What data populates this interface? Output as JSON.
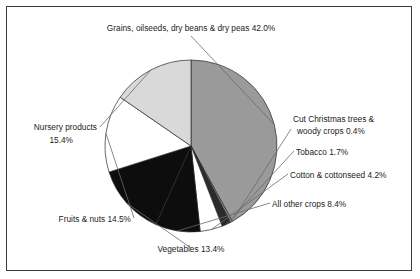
{
  "chart_data": {
    "type": "pie",
    "title": "",
    "subtitle": "",
    "xlabel": "",
    "ylabel": "",
    "legend_position": "none",
    "grid": false,
    "start_angle_deg": -90,
    "direction": "clockwise",
    "units": "percent",
    "total": 100.0,
    "categories": [
      "Grains, oilseeds, dry beans & dry peas",
      "Cut Christmas trees & woody crops",
      "Tobacco",
      "Cotton & cottonseed",
      "All other crops",
      "Vegetables",
      "Fruits & nuts",
      "Nursery products"
    ],
    "values": [
      42.0,
      0.4,
      1.7,
      4.2,
      8.4,
      13.4,
      14.5,
      15.4
    ],
    "colors": [
      "#9a9a9a",
      "#8f8f8f",
      "#2b2b2b",
      "#ffffff",
      "#0d0d0d",
      "#0d0d0d",
      "#ffffff",
      "#d9d9d9"
    ],
    "slices": [
      {
        "name": "grains-oilseeds-dry-beans-dry-peas",
        "label": "Grains, oilseeds, dry beans & dry peas 42.0%",
        "value": 42.0,
        "color": "#9a9a9a"
      },
      {
        "name": "cut-christmas-trees-woody-crops",
        "label_line1": "Cut Christmas trees &",
        "label_line2": "woody crops 0.4%",
        "value": 0.4,
        "color": "#8f8f8f"
      },
      {
        "name": "tobacco",
        "label": "Tobacco 1.7%",
        "value": 1.7,
        "color": "#2b2b2b"
      },
      {
        "name": "cotton-cottonseed",
        "label": "Cotton & cottonseed 4.2%",
        "value": 4.2,
        "color": "#ffffff"
      },
      {
        "name": "all-other-crops",
        "label": "All other crops 8.4%",
        "value": 8.4,
        "color": "#0d0d0d"
      },
      {
        "name": "vegetables",
        "label": "Vegetables 13.4%",
        "value": 13.4,
        "color": "#0d0d0d"
      },
      {
        "name": "fruits-nuts",
        "label": "Fruits & nuts 14.5%",
        "value": 14.5,
        "color": "#ffffff"
      },
      {
        "name": "nursery-products",
        "label_line1": "Nursery products",
        "label_line2": "15.4%",
        "value": 15.4,
        "color": "#d9d9d9"
      }
    ]
  },
  "labels": {
    "grains": "Grains, oilseeds, dry beans & dry peas 42.0%",
    "christmas_line1": "Cut Christmas trees &",
    "christmas_line2": "woody crops 0.4%",
    "tobacco": "Tobacco 1.7%",
    "cotton": "Cotton & cottonseed 4.2%",
    "all_other": "All other crops 8.4%",
    "vegetables": "Vegetables 13.4%",
    "fruits": "Fruits & nuts 14.5%",
    "nursery_line1": "Nursery products",
    "nursery_line2": "15.4%"
  },
  "style": {
    "frame_color": "#3b3b3b",
    "background": "#ffffff",
    "text_color": "#1b1b1b",
    "leader_color": "#6a6a6a"
  }
}
